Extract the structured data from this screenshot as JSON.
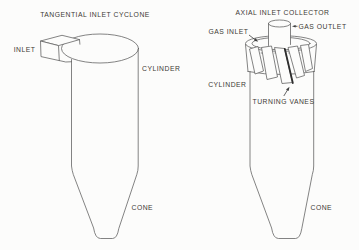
{
  "figure": {
    "description_colors": {
      "background": "#fcfcfb",
      "line": "#5b5b5b",
      "text": "#3d3935",
      "highlight_vane_edge": "#2e2e2e"
    },
    "left_diagram": {
      "title": "TANGENTIAL INLET CYCLONE",
      "labels": {
        "inlet": "INLET",
        "cylinder": "CYLINDER",
        "cone": "CONE"
      }
    },
    "right_diagram": {
      "title": "AXIAL INLET COLLECTOR",
      "labels": {
        "gas_inlet": "GAS INLET",
        "gas_outlet": "GAS OUTLET",
        "cylinder": "CYLINDER",
        "turning_vanes": "TURNING VANES",
        "cone": "CONE"
      }
    }
  }
}
